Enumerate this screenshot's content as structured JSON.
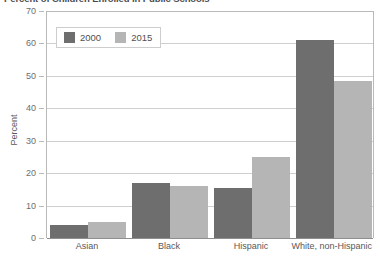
{
  "title": "Percent of Children Enrolled in Public Schools",
  "legend": {
    "items": [
      {
        "label": "2000",
        "color": "#6e6e6e"
      },
      {
        "label": "2015",
        "color": "#b5b5b5"
      }
    ]
  },
  "axes": {
    "ylabel": "Percent",
    "yticks": [
      "0",
      "10",
      "20",
      "30",
      "40",
      "50",
      "60",
      "70"
    ]
  },
  "chart_data": {
    "type": "bar",
    "title": "Percent of Children Enrolled in Public Schools",
    "xlabel": "",
    "ylabel": "Percent",
    "ylim": [
      0,
      70
    ],
    "ytick_step": 10,
    "grid": true,
    "legend_position": "top-left inside plot",
    "categories": [
      "Asian",
      "Black",
      "Hispanic",
      "White, non-Hispanic"
    ],
    "series": [
      {
        "name": "2000",
        "color": "#6e6e6e",
        "values": [
          4,
          17,
          15.5,
          61
        ]
      },
      {
        "name": "2015",
        "color": "#b5b5b5",
        "values": [
          5,
          16,
          25,
          48.5
        ]
      }
    ]
  }
}
